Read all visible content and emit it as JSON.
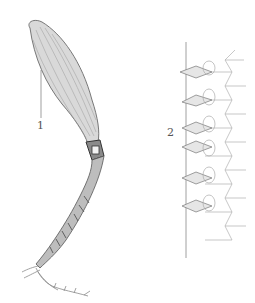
{
  "figure": {
    "labels": [
      {
        "id": "1",
        "text": "1",
        "x": 38,
        "y": 122
      },
      {
        "id": "2",
        "text": "2",
        "x": 168,
        "y": 129
      }
    ],
    "colors": {
      "background": "#ffffff",
      "ink_dark": "#333333",
      "ink_mid": "#777777",
      "ink_light": "#b5b5b5",
      "label": "#555555"
    }
  }
}
